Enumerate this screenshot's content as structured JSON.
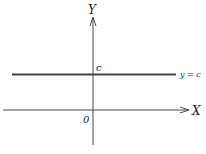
{
  "diagram": {
    "axes": {
      "x_label": "X",
      "y_label": "Y",
      "origin_label": "0"
    },
    "line": {
      "intercept_label": "c",
      "equation_label": "y = c"
    },
    "colors": {
      "stroke": "#333333",
      "line": "#444444",
      "text": "#222222"
    }
  }
}
